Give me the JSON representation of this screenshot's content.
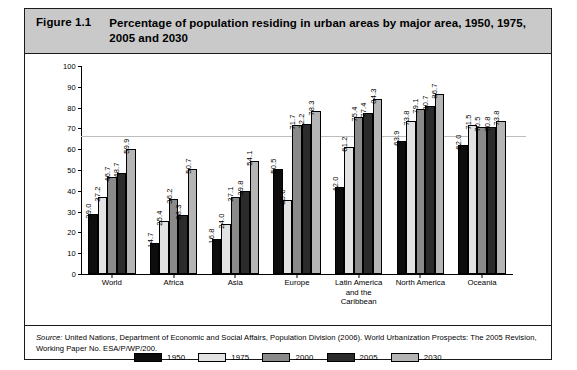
{
  "figure": {
    "number": "Figure 1.1",
    "title": "Percentage of population residing in urban areas by major area, 1950, 1975, 2005 and 2030",
    "source_prefix": "Source:",
    "source_text": " United Nations, Department of Economic and Social Affairs, Population Division (2006). World Urbanization Prospects: The 2005 Revision, Working Paper No. ESA/P/WP/200."
  },
  "colors": {
    "title_band": "#c9c9c9",
    "border": "#1a1a1a",
    "series_1950": "#0d0d0d",
    "series_1975": "#e2e2e2",
    "series_2000": "#8a8a8a",
    "series_2005": "#2b2b2b",
    "series_2030": "#b5b5b5",
    "reference_line": "#bdbdbd"
  },
  "chart_data": {
    "type": "bar",
    "title": "Percentage of population residing in urban areas by major area, 1950, 1975, 2005 and 2030",
    "xlabel": "",
    "ylabel": "",
    "ylim": [
      0,
      100
    ],
    "yticks": [
      0,
      10,
      20,
      30,
      40,
      50,
      60,
      70,
      80,
      90,
      100
    ],
    "grid": false,
    "legend_position": "bottom",
    "reference_line_value": 66.5,
    "categories": [
      "World",
      "Africa",
      "Asia",
      "Europe",
      "Latin America and the Caribbean",
      "North America",
      "Oceania"
    ],
    "category_lines": [
      [
        "World"
      ],
      [
        "Africa"
      ],
      [
        "Asia"
      ],
      [
        "Europe"
      ],
      [
        "Latin America",
        "and the",
        "Caribbean"
      ],
      [
        "North America"
      ],
      [
        "Oceania"
      ]
    ],
    "series": [
      {
        "name": "1950",
        "color": "#0d0d0d",
        "values": [
          29.0,
          14.7,
          16.8,
          50.5,
          42.0,
          63.9,
          62.0
        ]
      },
      {
        "name": "1975",
        "color": "#e2e2e2",
        "values": [
          37.2,
          25.4,
          24.0,
          35.6,
          61.2,
          73.8,
          71.5
        ]
      },
      {
        "name": "2000",
        "color": "#8a8a8a",
        "values": [
          46.7,
          36.2,
          37.1,
          71.7,
          75.4,
          79.1,
          70.5
        ]
      },
      {
        "name": "2005",
        "color": "#2b2b2b",
        "values": [
          48.7,
          28.3,
          39.8,
          72.2,
          77.4,
          80.7,
          70.8
        ]
      },
      {
        "name": "2030",
        "color": "#b5b5b5",
        "values": [
          59.9,
          50.7,
          54.1,
          78.3,
          84.3,
          86.7,
          73.8
        ]
      }
    ]
  }
}
